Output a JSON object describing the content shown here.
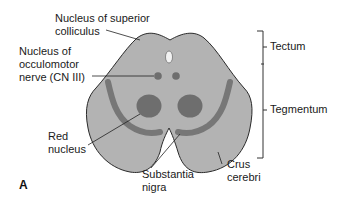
{
  "figure": {
    "panel_label": "A",
    "colors": {
      "background": "#ffffff",
      "midbrain_fill": "#b3b3b3",
      "nuclei_fill": "#6e6e6e",
      "substantia_nigra_band": "#777777",
      "aqueduct_fill": "#f2f2f2",
      "outline": "#2a2a2a",
      "leader_line": "#222222"
    },
    "labels": {
      "superior_colliculus": "Nucleus of superior\ncolliculus",
      "oculomotor": "Nucleus of\nocculomotor\nnerve (CN III)",
      "red_nucleus": "Red\nnucleus",
      "substantia_nigra": "Substantia\nnigra",
      "crus_cerebri": "Crus\ncerebri",
      "tectum": "Tectum",
      "tegmentum": "Tegmentum"
    }
  }
}
